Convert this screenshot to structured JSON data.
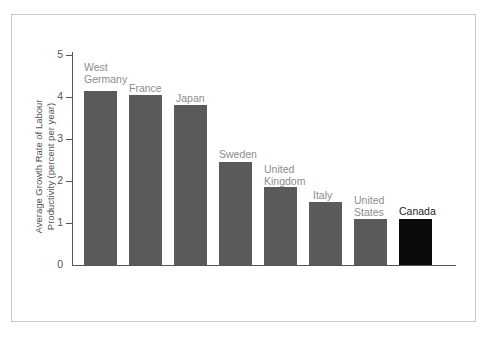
{
  "figure": {
    "background_color": "#ffffff",
    "frame_color": "#c8c8c8"
  },
  "chart_data": {
    "type": "bar",
    "title": "",
    "xlabel": "",
    "ylabel": "Average Growth Rate of Labour\nProductivity (percent per year)",
    "categories": [
      "West Germany",
      "France",
      "Japan",
      "Sweden",
      "United Kingdom",
      "Italy",
      "United States",
      "Canada"
    ],
    "values": [
      4.15,
      4.05,
      3.8,
      2.45,
      1.85,
      1.5,
      1.1,
      1.1
    ],
    "ylim": [
      0,
      5
    ],
    "yticks": [
      0,
      1,
      2,
      3,
      4,
      5
    ],
    "ytick_labels": [
      "0",
      "1",
      "2",
      "3",
      "4",
      "5"
    ],
    "grid": false,
    "legend": false,
    "bar_colors": [
      "#5a5a5a",
      "#5a5a5a",
      "#5a5a5a",
      "#5a5a5a",
      "#5a5a5a",
      "#5a5a5a",
      "#5a5a5a",
      "#0a0a0a"
    ],
    "highlight_category": "Canada",
    "label_color": "#8c8c8c",
    "highlight_label_color": "#262626",
    "axis_color": "#555555"
  },
  "bars": [
    {
      "name": "West Germany",
      "label": "West\nGermany",
      "value": 4.15,
      "color": "gray",
      "x": 84,
      "label_x": 84,
      "label_y": 62,
      "highlight": false
    },
    {
      "name": "France",
      "label": "France",
      "value": 4.05,
      "color": "gray",
      "x": 129,
      "label_x": 129,
      "label_y": 83,
      "highlight": false
    },
    {
      "name": "Japan",
      "label": "Japan",
      "value": 3.8,
      "color": "gray",
      "x": 174,
      "label_x": 176,
      "label_y": 93,
      "highlight": false
    },
    {
      "name": "Sweden",
      "label": "Sweden",
      "value": 2.45,
      "color": "gray",
      "x": 219,
      "label_x": 219,
      "label_y": 149,
      "highlight": false
    },
    {
      "name": "United Kingdom",
      "label": "United\nKingdom",
      "value": 1.85,
      "color": "gray",
      "x": 264,
      "label_x": 264,
      "label_y": 164,
      "highlight": false
    },
    {
      "name": "Italy",
      "label": "Italy",
      "value": 1.5,
      "color": "gray",
      "x": 309,
      "label_x": 313,
      "label_y": 190,
      "highlight": false
    },
    {
      "name": "United States",
      "label": "United\nStates",
      "value": 1.1,
      "color": "gray",
      "x": 354,
      "label_x": 354,
      "label_y": 195,
      "highlight": false
    },
    {
      "name": "Canada",
      "label": "Canada",
      "value": 1.1,
      "color": "black",
      "x": 399,
      "label_x": 399,
      "label_y": 206,
      "highlight": true
    }
  ],
  "y_axis": {
    "title": "Average Growth Rate of Labour\nProductivity (percent per year)",
    "ticks": [
      {
        "label": "5",
        "value": 5
      },
      {
        "label": "4",
        "value": 4
      },
      {
        "label": "3",
        "value": 3
      },
      {
        "label": "2",
        "value": 2
      },
      {
        "label": "1",
        "value": 1
      },
      {
        "label": "0",
        "value": 0
      }
    ]
  }
}
